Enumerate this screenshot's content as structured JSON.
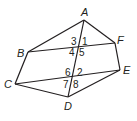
{
  "diagram": {
    "type": "geometry",
    "points": {
      "A": {
        "label": "A",
        "x": 84,
        "y": 20
      },
      "B": {
        "label": "B",
        "x": 28,
        "y": 52
      },
      "C": {
        "label": "C",
        "x": 15,
        "y": 84
      },
      "D": {
        "label": "D",
        "x": 68,
        "y": 97
      },
      "E": {
        "label": "E",
        "x": 120,
        "y": 70
      },
      "F": {
        "label": "F",
        "x": 115,
        "y": 43
      }
    },
    "segments": [
      [
        "A",
        "B"
      ],
      [
        "A",
        "F"
      ],
      [
        "B",
        "C"
      ],
      [
        "F",
        "E"
      ],
      [
        "C",
        "D"
      ],
      [
        "D",
        "E"
      ],
      [
        "B",
        "F"
      ],
      [
        "C",
        "E"
      ],
      [
        "A",
        "D"
      ]
    ],
    "angles": [
      "1",
      "2",
      "3",
      "4",
      "5",
      "6",
      "7",
      "8"
    ]
  }
}
